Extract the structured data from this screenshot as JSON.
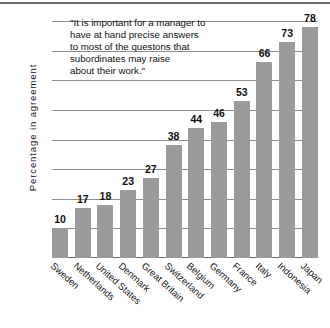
{
  "chart_data": {
    "type": "bar",
    "title": "",
    "xlabel": "",
    "ylabel": "Percentage  in  agreement",
    "ylim": [
      0,
      80
    ],
    "yticks": [
      0,
      10,
      20,
      30,
      40,
      50,
      60,
      70,
      80
    ],
    "grid": true,
    "legend": "none",
    "orientation": "vertical",
    "bar_color": "#9a9a9a",
    "categories": [
      "Sweden",
      "Netherlands",
      "United States",
      "Denmark",
      "Great Britain",
      "Switzerland",
      "Belgium",
      "Germany",
      "France",
      "Italy",
      "Indonesia",
      "Japan"
    ],
    "values": [
      10,
      17,
      18,
      23,
      27,
      38,
      44,
      46,
      53,
      66,
      73,
      78
    ],
    "annotations": [
      {
        "name": "quote-annotation",
        "lines": [
          "\"It is important for a manager to",
          "have at hand precise answers",
          "to most of the questons that",
          "subordinates may raise",
          "about their work.\""
        ]
      }
    ]
  }
}
